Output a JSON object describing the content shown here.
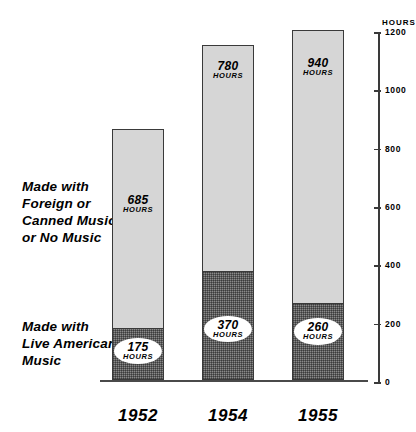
{
  "chart_data": {
    "type": "bar",
    "title": "",
    "xlabel": "",
    "ylabel": "HOURS",
    "ylim": [
      0,
      1200
    ],
    "ytick_values": [
      0,
      200,
      400,
      600,
      800,
      1000,
      1200
    ],
    "ytick_labels": [
      "0",
      "200",
      "400",
      "600",
      "800",
      "1000",
      "1200"
    ],
    "axis_position": "right",
    "grid": false,
    "stacked": true,
    "unit_label": "HOURS",
    "categories": [
      "1952",
      "1954",
      "1955"
    ],
    "series": [
      {
        "name": "Made with Live American Music",
        "values": [
          175,
          370,
          260
        ],
        "color": "#8a8a8a",
        "position": "bottom",
        "label_style": "white-oval"
      },
      {
        "name": "Made with Foreign or Canned Music or No Music",
        "values": [
          685,
          780,
          940
        ],
        "color": "#d6d6d6",
        "position": "top",
        "label_style": "plain"
      }
    ],
    "totals": [
      860,
      1150,
      1200
    ]
  },
  "legend": {
    "foreign": "Made with\nForeign or\nCanned Music\nor No Music",
    "live": "Made with\nLive American\nMusic"
  },
  "axis": {
    "title": "HOURS"
  },
  "bars": [
    {
      "year": "1952",
      "top_value": "685",
      "top_unit": "HOURS",
      "bottom_value": "175",
      "bottom_unit": "HOURS"
    },
    {
      "year": "1954",
      "top_value": "780",
      "top_unit": "HOURS",
      "bottom_value": "370",
      "bottom_unit": "HOURS"
    },
    {
      "year": "1955",
      "top_value": "940",
      "top_unit": "HOURS",
      "bottom_value": "260",
      "bottom_unit": "HOURS"
    }
  ]
}
